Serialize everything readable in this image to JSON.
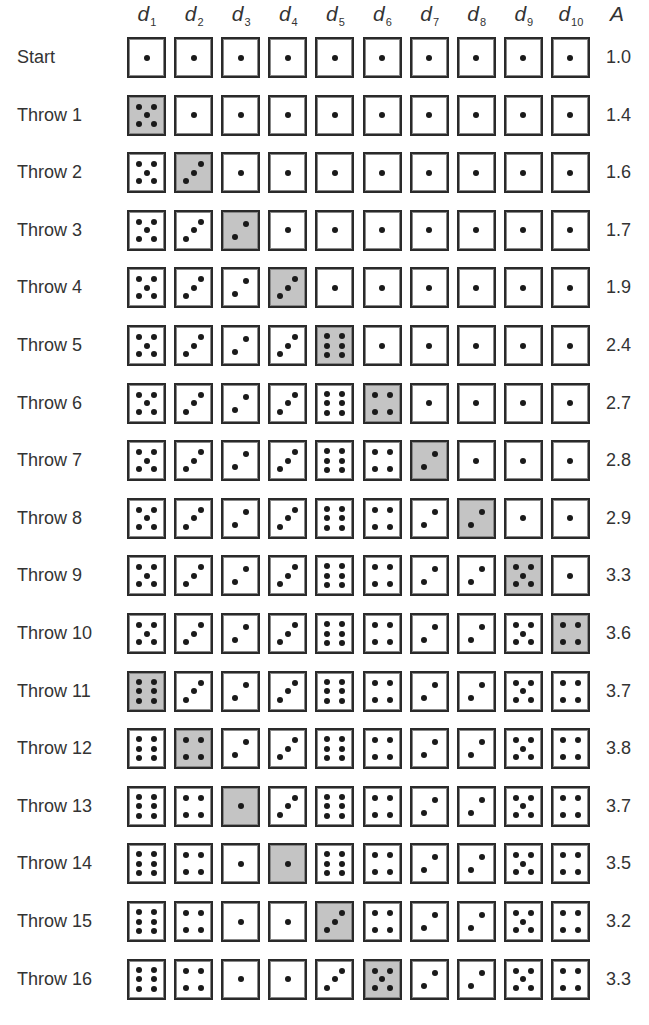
{
  "header": {
    "columns": [
      {
        "base": "d",
        "sub": "1"
      },
      {
        "base": "d",
        "sub": "2"
      },
      {
        "base": "d",
        "sub": "3"
      },
      {
        "base": "d",
        "sub": "4"
      },
      {
        "base": "d",
        "sub": "5"
      },
      {
        "base": "d",
        "sub": "6"
      },
      {
        "base": "d",
        "sub": "7"
      },
      {
        "base": "d",
        "sub": "8"
      },
      {
        "base": "d",
        "sub": "9"
      },
      {
        "base": "d",
        "sub": "10"
      }
    ],
    "average_label": "A"
  },
  "colors": {
    "highlight": "#c4c4c4",
    "border": "#2a2a2a",
    "pip": "#1a1a1a"
  },
  "rows": [
    {
      "label": "Start",
      "dice": [
        1,
        1,
        1,
        1,
        1,
        1,
        1,
        1,
        1,
        1
      ],
      "changed": null,
      "average": "1.0"
    },
    {
      "label": "Throw 1",
      "dice": [
        5,
        1,
        1,
        1,
        1,
        1,
        1,
        1,
        1,
        1
      ],
      "changed": 0,
      "average": "1.4"
    },
    {
      "label": "Throw 2",
      "dice": [
        5,
        3,
        1,
        1,
        1,
        1,
        1,
        1,
        1,
        1
      ],
      "changed": 1,
      "average": "1.6"
    },
    {
      "label": "Throw 3",
      "dice": [
        5,
        3,
        2,
        1,
        1,
        1,
        1,
        1,
        1,
        1
      ],
      "changed": 2,
      "average": "1.7"
    },
    {
      "label": "Throw 4",
      "dice": [
        5,
        3,
        2,
        3,
        1,
        1,
        1,
        1,
        1,
        1
      ],
      "changed": 3,
      "average": "1.9"
    },
    {
      "label": "Throw 5",
      "dice": [
        5,
        3,
        2,
        3,
        6,
        1,
        1,
        1,
        1,
        1
      ],
      "changed": 4,
      "average": "2.4"
    },
    {
      "label": "Throw 6",
      "dice": [
        5,
        3,
        2,
        3,
        6,
        4,
        1,
        1,
        1,
        1
      ],
      "changed": 5,
      "average": "2.7"
    },
    {
      "label": "Throw 7",
      "dice": [
        5,
        3,
        2,
        3,
        6,
        4,
        2,
        1,
        1,
        1
      ],
      "changed": 6,
      "average": "2.8"
    },
    {
      "label": "Throw 8",
      "dice": [
        5,
        3,
        2,
        3,
        6,
        4,
        2,
        2,
        1,
        1
      ],
      "changed": 7,
      "average": "2.9"
    },
    {
      "label": "Throw 9",
      "dice": [
        5,
        3,
        2,
        3,
        6,
        4,
        2,
        2,
        5,
        1
      ],
      "changed": 8,
      "average": "3.3"
    },
    {
      "label": "Throw 10",
      "dice": [
        5,
        3,
        2,
        3,
        6,
        4,
        2,
        2,
        5,
        4
      ],
      "changed": 9,
      "average": "3.6"
    },
    {
      "label": "Throw 11",
      "dice": [
        6,
        3,
        2,
        3,
        6,
        4,
        2,
        2,
        5,
        4
      ],
      "changed": 0,
      "average": "3.7"
    },
    {
      "label": "Throw 12",
      "dice": [
        6,
        4,
        2,
        3,
        6,
        4,
        2,
        2,
        5,
        4
      ],
      "changed": 1,
      "average": "3.8"
    },
    {
      "label": "Throw 13",
      "dice": [
        6,
        4,
        1,
        3,
        6,
        4,
        2,
        2,
        5,
        4
      ],
      "changed": 2,
      "average": "3.7"
    },
    {
      "label": "Throw 14",
      "dice": [
        6,
        4,
        1,
        1,
        6,
        4,
        2,
        2,
        5,
        4
      ],
      "changed": 3,
      "average": "3.5"
    },
    {
      "label": "Throw 15",
      "dice": [
        6,
        4,
        1,
        1,
        3,
        4,
        2,
        2,
        5,
        4
      ],
      "changed": 4,
      "average": "3.2"
    },
    {
      "label": "Throw 16",
      "dice": [
        6,
        4,
        1,
        1,
        3,
        5,
        2,
        2,
        5,
        4
      ],
      "changed": 5,
      "average": "3.3"
    }
  ]
}
